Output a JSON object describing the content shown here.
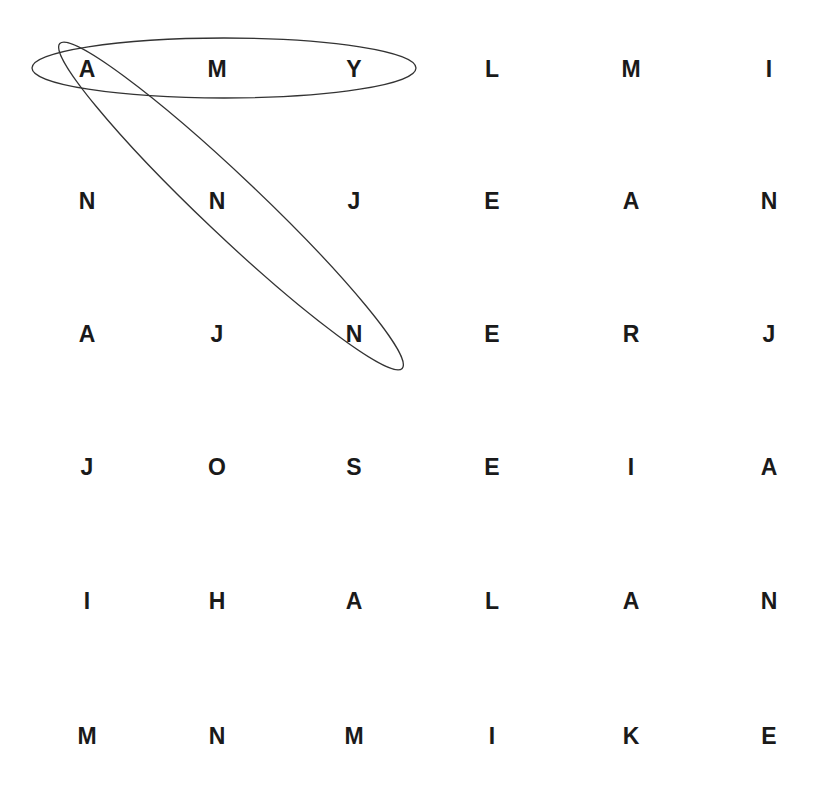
{
  "puzzle": {
    "type": "word-search",
    "rows": [
      [
        "A",
        "M",
        "Y",
        "L",
        "M",
        "I"
      ],
      [
        "N",
        "N",
        "J",
        "E",
        "A",
        "N"
      ],
      [
        "A",
        "J",
        "N",
        "E",
        "R",
        "J"
      ],
      [
        "J",
        "O",
        "S",
        "E",
        "I",
        "A"
      ],
      [
        "I",
        "H",
        "A",
        "L",
        "A",
        "N"
      ],
      [
        "M",
        "N",
        "M",
        "I",
        "K",
        "E"
      ]
    ],
    "col_x": [
      87,
      217,
      354,
      492,
      631,
      769
    ],
    "row_y": [
      69,
      201,
      334,
      467,
      601,
      736
    ],
    "found_words": [
      {
        "word": "AMY",
        "direction": "horizontal",
        "cells": [
          [
            0,
            0
          ],
          [
            0,
            1
          ],
          [
            0,
            2
          ]
        ]
      },
      {
        "word": "ANN",
        "direction": "diagonal",
        "cells": [
          [
            0,
            0
          ],
          [
            1,
            1
          ],
          [
            2,
            2
          ]
        ]
      }
    ],
    "colors": {
      "letter": "#1a1a1a",
      "circle": "#333333",
      "background": "#ffffff"
    }
  }
}
